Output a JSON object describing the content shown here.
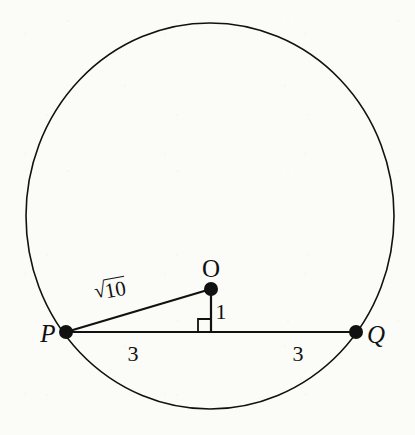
{
  "figure": {
    "type": "geometry-diagram",
    "background_color": "#fbfbf8",
    "stroke_color": "#111111",
    "circle": {
      "name": "circle",
      "center_x": 210,
      "center_y": 216,
      "radius_x": 184,
      "radius_y": 193,
      "stroke_width": 1.6
    },
    "points": [
      {
        "id": "P",
        "label": "P",
        "x": 66,
        "y": 332,
        "label_x": 48,
        "label_y": 333,
        "dot_radius": 7
      },
      {
        "id": "O",
        "label": "O",
        "x": 211,
        "y": 289,
        "label_x": 211,
        "label_y": 268,
        "dot_radius": 7
      },
      {
        "id": "Q",
        "label": "Q",
        "x": 356,
        "y": 332,
        "label_x": 376,
        "label_y": 334,
        "dot_radius": 7
      }
    ],
    "segments": [
      {
        "id": "chord-PQ",
        "from": "P",
        "to": "Q",
        "x1": 66,
        "y1": 332,
        "x2": 356,
        "y2": 332,
        "stroke_width": 2
      },
      {
        "id": "radius-PO",
        "from": "P",
        "to": "O",
        "x1": 66,
        "y1": 332,
        "x2": 211,
        "y2": 289,
        "stroke_width": 2
      },
      {
        "id": "perpendicular-OM",
        "from": "O",
        "to": "M",
        "x1": 211,
        "y1": 289,
        "x2": 211,
        "y2": 332,
        "stroke_width": 2
      }
    ],
    "right_angle": {
      "id": "right-angle-marker",
      "vertex_x": 211,
      "vertex_y": 332,
      "size": 13,
      "direction": "left-up",
      "stroke_width": 1.8
    },
    "measure_labels": [
      {
        "id": "hypotenuse",
        "text": "10",
        "prefix": "√",
        "is_radical": true,
        "x": 110,
        "y": 290,
        "rotation_deg": -10
      },
      {
        "id": "perpendicular-length",
        "text": "1",
        "is_radical": false,
        "x": 221,
        "y": 312,
        "rotation_deg": 0
      },
      {
        "id": "half-chord-left",
        "text": "3",
        "is_radical": false,
        "x": 133,
        "y": 354,
        "rotation_deg": 0
      },
      {
        "id": "half-chord-right",
        "text": "3",
        "is_radical": false,
        "x": 298,
        "y": 354,
        "rotation_deg": 0
      }
    ]
  }
}
